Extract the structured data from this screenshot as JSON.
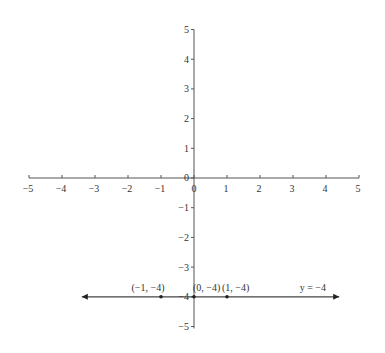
{
  "chart_data": {
    "type": "line",
    "title": "",
    "xlabel": "",
    "ylabel": "",
    "xlim": [
      -5,
      5
    ],
    "ylim": [
      -5,
      5
    ],
    "grid": false,
    "x_ticks": [
      -5,
      -4,
      -3,
      -2,
      -1,
      0,
      1,
      2,
      3,
      4,
      5
    ],
    "y_ticks": [
      -5,
      -4,
      -3,
      -2,
      -1,
      0,
      1,
      2,
      3,
      4,
      5
    ],
    "x_tick_labels": [
      "−5",
      "−4",
      "−3",
      "−2",
      "−1",
      "0",
      "1",
      "2",
      "3",
      "4",
      "5"
    ],
    "y_tick_labels": [
      "−5",
      "−4",
      "−3",
      "−2",
      "−1",
      "0",
      "1",
      "2",
      "3",
      "4",
      "5"
    ],
    "series": [
      {
        "name": "y = −4",
        "equation": "y = -4",
        "line_x_range": [
          -3.4,
          4.4
        ],
        "arrows": "both",
        "x": [
          -1,
          0,
          1
        ],
        "y": [
          -4,
          -4,
          -4
        ]
      }
    ],
    "annotations": [
      {
        "text": "(−1, −4)",
        "x": -1,
        "y": -4
      },
      {
        "text": "(0, −4)",
        "x": 0,
        "y": -4
      },
      {
        "text": "(1, −4)",
        "x": 1,
        "y": -4
      },
      {
        "text": "y = −4",
        "x": 3.6,
        "y": -4
      }
    ],
    "colors": {
      "axis": "#555555",
      "line": "#444444",
      "text": "#333333"
    }
  }
}
